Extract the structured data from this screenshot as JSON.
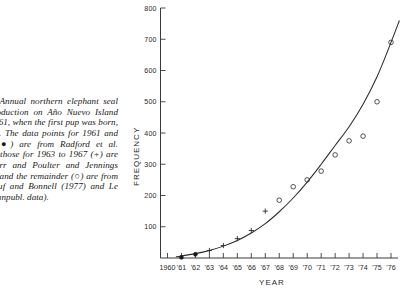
{
  "caption": {
    "lead": "URE",
    "number": "4.",
    "text": " Annual northern elephant seal pup production on Año Nuevo Island from 1961, when the first pup was born, to 1978. The data points for 1961 and 1962 (●) are from Radford et al. (1965), those for 1963 to 1967 (+) are from Orr and Poulter and Jennings (1971), and the remainder (○) are from Le Boeuf and Bonnell (1977) and Le Boeuf (unpubl. data)."
  },
  "chart_data": {
    "type": "scatter",
    "title": "",
    "xlabel": "YEAR",
    "ylabel": "FREQUENCY",
    "xlim": [
      1959.5,
      1976.5
    ],
    "ylim": [
      0,
      800
    ],
    "grid": false,
    "legend_position": "none",
    "x_tick_labels": [
      "1960",
      "'61",
      "'62",
      "'63",
      "'64",
      "'65",
      "'66",
      "'67",
      "'68",
      "'69",
      "'70",
      "'71",
      "'72",
      "'73",
      "'74",
      "'75",
      "'76"
    ],
    "x_ticks": [
      1960,
      1961,
      1962,
      1963,
      1964,
      1965,
      1966,
      1967,
      1968,
      1969,
      1970,
      1971,
      1972,
      1973,
      1974,
      1975,
      1976
    ],
    "y_tick_labels": [
      "100",
      "200",
      "300",
      "400",
      "500",
      "600",
      "700",
      "800"
    ],
    "y_ticks": [
      100,
      200,
      300,
      400,
      500,
      600,
      700,
      800
    ],
    "series": [
      {
        "name": "Radford et al. (1965)",
        "marker": "filled-circle",
        "x": [
          1961,
          1962
        ],
        "values": [
          2,
          12
        ]
      },
      {
        "name": "Orr and Poulter / Jennings",
        "marker": "plus",
        "x": [
          1963,
          1964,
          1965,
          1966,
          1967
        ],
        "values": [
          24,
          40,
          62,
          88,
          150
        ]
      },
      {
        "name": "Le Boeuf and Bonnell (1977) / Le Boeuf unpubl.",
        "marker": "open-circle",
        "x": [
          1968,
          1969,
          1970,
          1971,
          1972,
          1973,
          1974,
          1975,
          1976
        ],
        "values": [
          185,
          228,
          250,
          278,
          330,
          375,
          390,
          500,
          690
        ]
      }
    ],
    "fit_curve": {
      "type": "exponential",
      "x": [
        1960.6,
        1962,
        1963,
        1964,
        1965,
        1966,
        1967,
        1968,
        1969,
        1970,
        1971,
        1972,
        1973,
        1974,
        1975,
        1976,
        1976.6
      ],
      "values": [
        4,
        14,
        24,
        38,
        56,
        80,
        110,
        148,
        192,
        243,
        300,
        360,
        420,
        492,
        580,
        690,
        760
      ]
    }
  }
}
